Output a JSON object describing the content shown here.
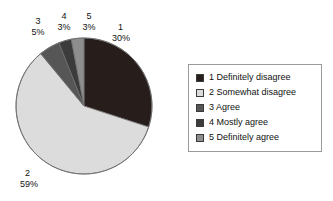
{
  "chart_data": {
    "type": "pie",
    "title": "",
    "xlabel": "",
    "ylabel": "",
    "legend_position": "right",
    "grid": false,
    "categories": [
      "1 Definitely disagree",
      "2 Somewhat disagree",
      "3 Agree",
      "4 Mostly agree",
      "5 Definitely agree"
    ],
    "values": [
      30,
      59,
      5,
      3,
      3
    ],
    "value_unit": "%",
    "slices": [
      {
        "key": "1",
        "name": "1 Definitely disagree",
        "label": "1",
        "percent_text": "30%",
        "value": 30,
        "color": "#271d1a",
        "start_angle": 0,
        "end_angle": 108
      },
      {
        "key": "2",
        "name": "2 Somewhat disagree",
        "label": "2",
        "percent_text": "59%",
        "value": 59,
        "color": "#dcdcdc",
        "start_angle": 108,
        "end_angle": 320.4
      },
      {
        "key": "3",
        "name": "3 Agree",
        "label": "3",
        "percent_text": "5%",
        "value": 5,
        "color": "#565656",
        "start_angle": 320.4,
        "end_angle": 338.4
      },
      {
        "key": "4",
        "name": "4 Mostly agree",
        "label": "4",
        "percent_text": "3%",
        "value": 3,
        "color": "#3b3b3b",
        "start_angle": 338.4,
        "end_angle": 349.2
      },
      {
        "key": "5",
        "name": "5 Definitely agree",
        "label": "5",
        "percent_text": "3%",
        "value": 3,
        "color": "#8e8e8e",
        "start_angle": 349.2,
        "end_angle": 360
      }
    ]
  },
  "legend": {
    "items": [
      {
        "label": "1 Definitely disagree",
        "color": "#271d1a"
      },
      {
        "label": "2 Somewhat disagree",
        "color": "#dcdcdc"
      },
      {
        "label": "3 Agree",
        "color": "#565656"
      },
      {
        "label": "4 Mostly agree",
        "color": "#3b3b3b"
      },
      {
        "label": "5 Definitely agree",
        "color": "#8e8e8e"
      }
    ]
  },
  "colors": {
    "background": "#ffffff",
    "pie_outline": "#6f6f6f",
    "legend_border": "#9a9a9a",
    "text": "#111111"
  }
}
